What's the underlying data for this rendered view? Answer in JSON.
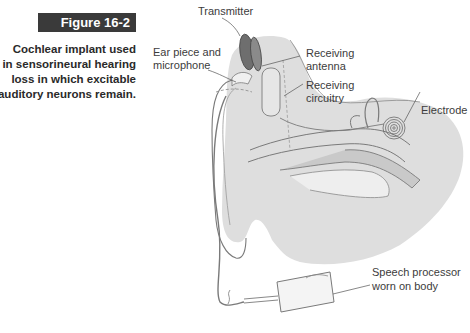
{
  "figure": {
    "number_label": "Figure 16-2",
    "caption_lines": [
      "Cochlear implant used",
      "in sensorineural hearing",
      "loss in which excitable",
      "auditory neurons remain."
    ]
  },
  "labels": {
    "transmitter": "Transmitter",
    "ear_piece_line1": "Ear piece and",
    "ear_piece_line2": "microphone",
    "receiving_antenna_line1": "Receiving",
    "receiving_antenna_line2": "antenna",
    "receiving_circuitry_line1": "Receiving",
    "receiving_circuitry_line2": "circuitry",
    "electrode": "Electrode",
    "speech_processor_line1": "Speech processor",
    "speech_processor_line2": "worn on body"
  },
  "colors": {
    "figure_bar": "#3a3a3a",
    "head_fill": "#dcdcdc",
    "transmitter_fill": "#707070",
    "line": "#6a6a6a"
  }
}
